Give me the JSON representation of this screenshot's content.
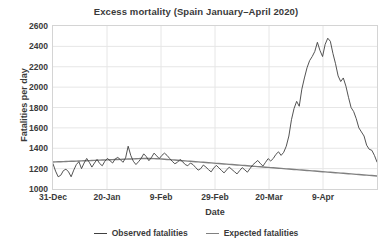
{
  "chart_data": {
    "type": "line",
    "title": "Excess mortality (Spain January–April 2020)",
    "xlabel": "Date",
    "ylabel": "Fatalities per day",
    "ylim": [
      1000,
      2600
    ],
    "yticks": [
      1000,
      1200,
      1400,
      1600,
      1800,
      2000,
      2200,
      2400,
      2600
    ],
    "xticks": [
      "31-Dec",
      "20-Jan",
      "9-Feb",
      "29-Feb",
      "20-Mar",
      "9-Apr"
    ],
    "xtick_days": [
      0,
      20,
      40,
      60,
      80,
      100
    ],
    "xlim_days": [
      0,
      120
    ],
    "grid": "horizontal-and-vertical",
    "legend_position": "bottom-center",
    "colors": {
      "observed": "#404040",
      "expected": "#808080",
      "grid": "#e6e6e6",
      "frame": "#d4d4d4",
      "text": "#3a3a3a",
      "background": "#ffffff"
    },
    "series": [
      {
        "name": "Observed fatalities",
        "color": "#404040",
        "values": [
          1248,
          1175,
          1120,
          1135,
          1180,
          1195,
          1168,
          1120,
          1185,
          1240,
          1268,
          1200,
          1255,
          1300,
          1262,
          1215,
          1255,
          1290,
          1250,
          1228,
          1272,
          1300,
          1278,
          1255,
          1295,
          1310,
          1288,
          1262,
          1305,
          1420,
          1330,
          1272,
          1240,
          1268,
          1300,
          1345,
          1318,
          1278,
          1310,
          1352,
          1325,
          1298,
          1330,
          1352,
          1330,
          1300,
          1272,
          1248,
          1262,
          1290,
          1268,
          1240,
          1228,
          1255,
          1240,
          1212,
          1185,
          1200,
          1235,
          1215,
          1190,
          1168,
          1205,
          1232,
          1208,
          1182,
          1158,
          1188,
          1215,
          1192,
          1170,
          1148,
          1180,
          1210,
          1188,
          1165,
          1200,
          1235,
          1258,
          1280,
          1250,
          1225,
          1262,
          1298,
          1275,
          1300,
          1340,
          1365,
          1330,
          1360,
          1420,
          1520,
          1680,
          1790,
          1860,
          1812,
          1980,
          2090,
          2190,
          2260,
          2300,
          2350,
          2440,
          2360,
          2300,
          2420,
          2480,
          2450,
          2330,
          2230,
          2110,
          2055,
          2090,
          2010,
          1900,
          1800,
          1760,
          1690,
          1600,
          1560,
          1520,
          1430,
          1390,
          1380,
          1330,
          1265
        ]
      },
      {
        "name": "Expected fatalities",
        "color": "#808080",
        "values": [
          1265,
          1266,
          1267,
          1268,
          1269,
          1270,
          1271,
          1272,
          1273,
          1274,
          1275,
          1276,
          1277,
          1278,
          1279,
          1280,
          1281,
          1282,
          1283,
          1284,
          1285,
          1286,
          1287,
          1288,
          1289,
          1290,
          1291,
          1292,
          1293,
          1294,
          1295,
          1296,
          1297,
          1298,
          1299,
          1300,
          1300,
          1300,
          1299,
          1298,
          1297,
          1296,
          1294,
          1292,
          1290,
          1288,
          1286,
          1284,
          1282,
          1280,
          1278,
          1276,
          1274,
          1272,
          1270,
          1268,
          1266,
          1264,
          1262,
          1260,
          1258,
          1256,
          1254,
          1252,
          1250,
          1248,
          1246,
          1244,
          1242,
          1240,
          1238,
          1236,
          1234,
          1232,
          1230,
          1228,
          1226,
          1224,
          1222,
          1220,
          1218,
          1216,
          1214,
          1212,
          1210,
          1208,
          1206,
          1204,
          1202,
          1200,
          1198,
          1196,
          1194,
          1192,
          1190,
          1188,
          1186,
          1184,
          1182,
          1180,
          1178,
          1176,
          1174,
          1172,
          1170,
          1168,
          1166,
          1164,
          1162,
          1160,
          1158,
          1156,
          1154,
          1152,
          1150,
          1148,
          1146,
          1144,
          1142,
          1140,
          1138,
          1136,
          1134,
          1132,
          1130,
          1128
        ]
      }
    ],
    "legend": [
      {
        "label": "Observed fatalities",
        "color": "#404040"
      },
      {
        "label": "Expected fatalities",
        "color": "#808080"
      }
    ]
  }
}
